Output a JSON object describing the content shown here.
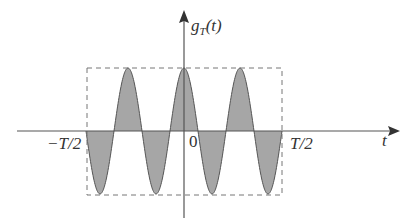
{
  "figure": {
    "type": "diagram",
    "title": "",
    "y_axis_label": "g",
    "y_axis_label_subscript": "T",
    "y_axis_label_suffix": "(t)",
    "x_axis_label": "t",
    "tick_left": "−T/2",
    "tick_origin": "0",
    "tick_right": "T/2",
    "colors": {
      "fill": "#a6a6a6",
      "curve": "#555555",
      "axis": "#555555",
      "dashed_box": "#777777"
    }
  }
}
